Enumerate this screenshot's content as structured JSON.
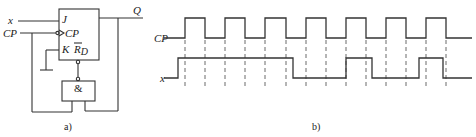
{
  "circuit": {
    "caption": "a)",
    "input_x_label": "x",
    "input_cp_label": "CP",
    "output_label": "Q",
    "flipflop": {
      "pin_j": "J",
      "pin_cp": "CP",
      "pin_k": "K",
      "pin_rd": "R",
      "pin_rd_sub": "D"
    },
    "and_gate_label": "&"
  },
  "timing": {
    "caption": "b)",
    "signals": [
      {
        "name": "CP",
        "high_y": 18,
        "low_y": 38,
        "start_x": 172,
        "end_x": 472,
        "initial": "low",
        "edges": [
          185,
          205,
          225,
          245,
          265,
          286,
          306,
          326,
          346,
          366,
          386,
          406,
          426,
          446
        ]
      },
      {
        "name": "x",
        "high_y": 58,
        "low_y": 78,
        "start_x": 172,
        "end_x": 472,
        "initial": "low",
        "edges": [
          178,
          293,
          346,
          372,
          419,
          443
        ]
      }
    ],
    "dashed_guides": {
      "x": [
        185,
        205,
        225,
        245,
        265,
        286,
        306,
        326,
        346,
        366,
        386,
        406,
        426,
        446
      ],
      "y_top": 40,
      "y_bottom": 86
    }
  }
}
